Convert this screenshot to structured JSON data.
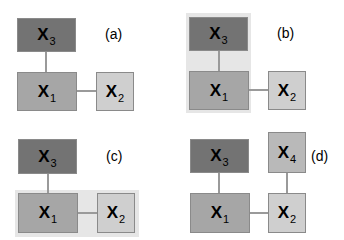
{
  "panels": {
    "a": {
      "label": "(a)",
      "x3": "X",
      "x3_sub": "3",
      "x1": "X",
      "x1_sub": "1",
      "x2": "X",
      "x2_sub": "2"
    },
    "b": {
      "label": "(b)",
      "x3": "X",
      "x3_sub": "3",
      "x1": "X",
      "x1_sub": "1",
      "x2": "X",
      "x2_sub": "2"
    },
    "c": {
      "label": "(c)",
      "x3": "X",
      "x3_sub": "3",
      "x1": "X",
      "x1_sub": "1",
      "x2": "X",
      "x2_sub": "2"
    },
    "d": {
      "label": "(d)",
      "x3": "X",
      "x3_sub": "3",
      "x4": "X",
      "x4_sub": "4",
      "x1": "X",
      "x1_sub": "1",
      "x2": "X",
      "x2_sub": "2"
    }
  },
  "colors": {
    "dark": "#737373",
    "mid": "#a6a6a6",
    "light": "#cfcfcf",
    "highlight": "#e6e6e6"
  }
}
